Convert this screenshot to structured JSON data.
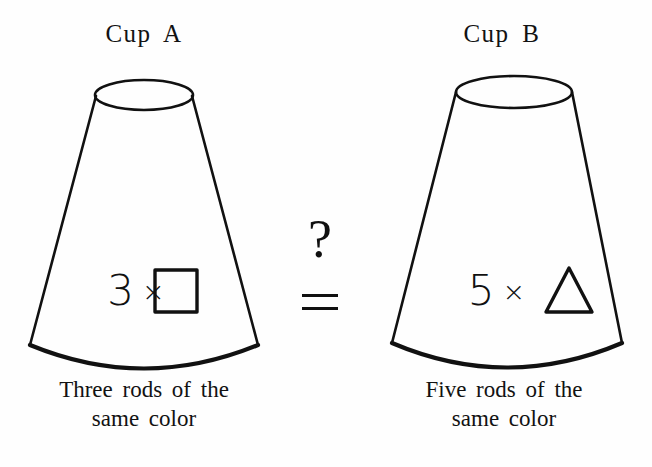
{
  "figure": {
    "background_color": "#fefefe",
    "ink_color": "#111111",
    "cups": [
      {
        "id": "cup-a",
        "title": "Cup A",
        "count": "3",
        "operator": "×",
        "shape_icon": "square-icon",
        "shape_glyph": "□",
        "caption_line_1": "Three rods of the",
        "caption_line_2": "same color"
      },
      {
        "id": "cup-b",
        "title": "Cup B",
        "count": "5",
        "operator": "×",
        "shape_icon": "triangle-icon",
        "shape_glyph": "△",
        "caption_line_1": "Five rods of the",
        "caption_line_2": "same color"
      }
    ],
    "relation": {
      "question_mark": "?",
      "equals_label": "=",
      "symbol_name": "questioned-equals"
    }
  }
}
